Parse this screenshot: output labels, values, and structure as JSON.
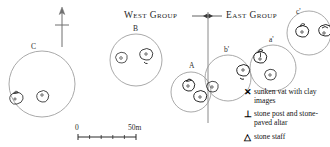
{
  "map": {
    "title_groups": {
      "west": "West Group",
      "east": "East Group"
    },
    "north_arrow": "north-arrow",
    "divider": "group-divider-line",
    "enclosures": [
      {
        "id": "C",
        "label": "C",
        "cx": 42,
        "cy": 84,
        "r": 33,
        "group": "west",
        "features": [
          {
            "type": "vat",
            "x": 16,
            "y": 98
          },
          {
            "type": "vat",
            "x": 42,
            "y": 96
          }
        ]
      },
      {
        "id": "B",
        "label": "B",
        "cx": 136,
        "cy": 60,
        "r": 26,
        "group": "west",
        "features": [
          {
            "type": "vat",
            "x": 121,
            "y": 58
          },
          {
            "type": "vat",
            "x": 146,
            "y": 55
          }
        ]
      },
      {
        "id": "A",
        "label": "A",
        "cx": 191,
        "cy": 92,
        "r": 20,
        "group": "west",
        "features": [
          {
            "type": "vat",
            "x": 188,
            "y": 85
          },
          {
            "type": "vat",
            "x": 199,
            "y": 97
          }
        ]
      },
      {
        "id": "b'",
        "label": "b'",
        "cx": 228,
        "cy": 78,
        "r": 23,
        "group": "east",
        "features": [
          {
            "type": "vat",
            "x": 212,
            "y": 87
          },
          {
            "type": "vat",
            "x": 243,
            "y": 72
          }
        ]
      },
      {
        "id": "a'",
        "label": "a'",
        "cx": 273,
        "cy": 68,
        "r": 23,
        "group": "east",
        "features": [
          {
            "type": "vat",
            "x": 260,
            "y": 59
          },
          {
            "type": "vat",
            "x": 270,
            "y": 76
          }
        ]
      },
      {
        "id": "c'",
        "label": "c'",
        "cx": 309,
        "cy": 33,
        "r": 22,
        "group": "east",
        "features": [
          {
            "type": "vat",
            "x": 302,
            "y": 33
          },
          {
            "type": "vat",
            "x": 325,
            "y": 32
          }
        ]
      }
    ],
    "scale_bar": {
      "start_label": "0",
      "end_label": "50m",
      "x": 78,
      "y": 133,
      "width": 58,
      "ticks": 5
    },
    "legend": {
      "items": [
        {
          "symbol": "✕",
          "symbol_name": "x-cross-icon",
          "text": "sunken vat with clay images"
        },
        {
          "symbol": "⊥",
          "symbol_name": "perp-icon",
          "text": "stone post and stone-paved altar"
        },
        {
          "symbol": "△",
          "symbol_name": "triangle-icon",
          "text": "stone staff"
        }
      ]
    },
    "colors": {
      "ink": "#2b2b2b",
      "enclosure_stroke": "#8a8a8a",
      "feature_stroke": "#1a1a1a",
      "background": "#ffffff"
    }
  }
}
